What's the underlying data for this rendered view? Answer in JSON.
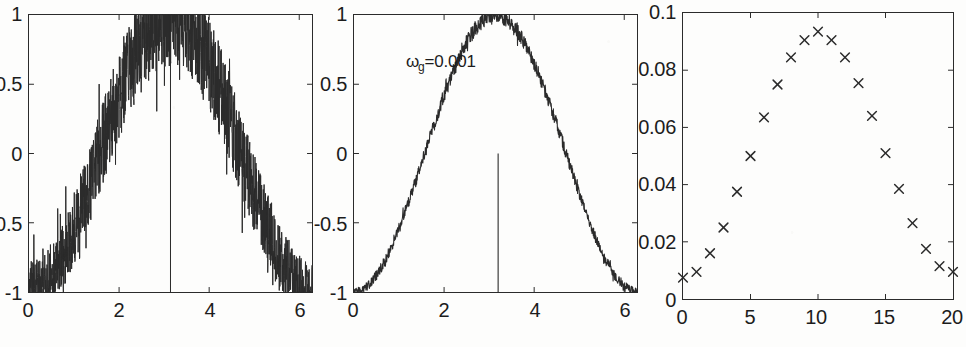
{
  "figure": {
    "background_color": "#fdfdfc",
    "ink_color": "#2b2b2b",
    "panel_count": 3
  },
  "panels": [
    {
      "id": "panel-1",
      "name": "noisy-cosine-heavy-noise",
      "annotation": "",
      "marker_spike_x": 3.14
    },
    {
      "id": "panel-2",
      "name": "noisy-cosine-light-noise",
      "annotation_omega": "ω",
      "annotation_sub": "g",
      "annotation_value": "=0.001",
      "annotation_full": "ωg=0.001",
      "marker_spike_x": 3.2
    },
    {
      "id": "panel-3",
      "name": "error-scatter",
      "annotation": ""
    }
  ],
  "chart_data": [
    {
      "type": "line",
      "title": "",
      "xlabel": "",
      "ylabel": "",
      "xlim": [
        0,
        6.2832
      ],
      "ylim": [
        -1,
        1
      ],
      "xticks": [
        0,
        2,
        4,
        6
      ],
      "xticklabels": [
        "0",
        "2",
        "4",
        "6"
      ],
      "yticks": [
        -1,
        -0.5,
        0,
        0.5,
        1
      ],
      "yticklabels": [
        "-1",
        "-0.5",
        "0",
        "0.5",
        "1"
      ],
      "grid": false,
      "legend": null,
      "series": [
        {
          "name": "noisy cosine (heavy noise)",
          "description": "-cos(x) trend buried in dense high-amplitude noise, clipped at +/-1",
          "noise_amplitude": 0.3,
          "samples": 1400,
          "trend": "-cos(x)"
        },
        {
          "name": "vertical spike",
          "description": "full-height vertical line at x=pi",
          "x": 3.1416,
          "y_from": -1,
          "y_to": 1
        }
      ]
    },
    {
      "type": "line",
      "title": "",
      "xlabel": "",
      "ylabel": "",
      "xlim": [
        0,
        6.2832
      ],
      "ylim": [
        -1,
        1
      ],
      "xticks": [
        0,
        2,
        4,
        6
      ],
      "xticklabels": [
        "0",
        "2",
        "4",
        "6"
      ],
      "yticks": [
        -1,
        -0.5,
        0,
        0.5,
        1
      ],
      "yticklabels": [
        "-1",
        "-0.5",
        "0",
        "0.5",
        "1"
      ],
      "grid": false,
      "legend": null,
      "annotations": [
        {
          "text": "ωg=0.001",
          "x": 1.35,
          "y": 0.74
        }
      ],
      "series": [
        {
          "name": "noisy cosine (light noise)",
          "description": "-cos(x) trend with small jitter",
          "noise_amplitude": 0.045,
          "samples": 900,
          "trend": "-cos(x)"
        },
        {
          "name": "vertical spike",
          "description": "narrow vertical line at x=3.2 rising from -1 to 0",
          "x": 3.2,
          "y_from": -1,
          "y_to": 0.0
        }
      ]
    },
    {
      "type": "scatter",
      "title": "",
      "xlabel": "",
      "ylabel": "",
      "marker": "x",
      "xlim": [
        0,
        20
      ],
      "ylim": [
        0,
        0.1
      ],
      "xticks": [
        0,
        5,
        10,
        15,
        20
      ],
      "xticklabels": [
        "0",
        "5",
        "10",
        "15",
        "20"
      ],
      "yticks": [
        0,
        0.02,
        0.04,
        0.06,
        0.08,
        0.1
      ],
      "yticklabels": [
        "0",
        "0.02",
        "0.04",
        "0.06",
        "0.08",
        "0.1"
      ],
      "grid": false,
      "legend": null,
      "x": [
        0,
        1,
        2,
        3,
        4,
        5,
        6,
        7,
        8,
        9,
        10,
        11,
        12,
        13,
        14,
        15,
        16,
        17,
        18,
        19,
        20
      ],
      "values": [
        0.0075,
        0.0095,
        0.016,
        0.025,
        0.0375,
        0.05,
        0.0635,
        0.075,
        0.0845,
        0.0905,
        0.0935,
        0.0905,
        0.0845,
        0.0755,
        0.064,
        0.051,
        0.0385,
        0.0265,
        0.0175,
        0.0115,
        0.0095
      ]
    }
  ]
}
